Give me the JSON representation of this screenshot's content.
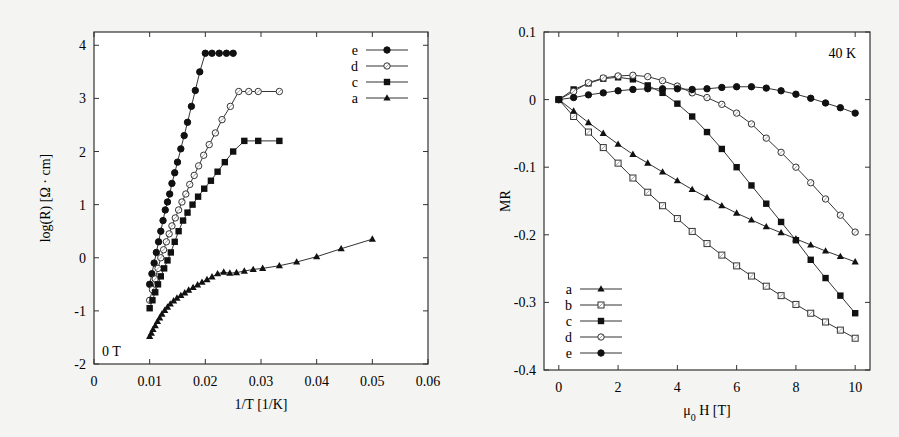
{
  "chart_data": [
    {
      "type": "line",
      "title": "",
      "annotation": "0 T",
      "xlabel": "1/T [1/K]",
      "ylabel": "log(R) [Ω · cm]",
      "xlim": [
        0,
        0.06
      ],
      "ylim": [
        -2,
        4.25
      ],
      "xticks": [
        "0",
        "0.01",
        "0.02",
        "0.03",
        "0.04",
        "0.05",
        "0.06"
      ],
      "yticks": [
        "-2",
        "-1",
        "0",
        "1",
        "2",
        "3",
        "4"
      ],
      "grid": false,
      "legend_position": "top-right",
      "legend": [
        "e",
        "d",
        "c",
        "a"
      ],
      "series": [
        {
          "name": "e",
          "marker": "filled-circle",
          "x": [
            0.01,
            0.0104,
            0.0108,
            0.0112,
            0.0116,
            0.012,
            0.0124,
            0.0128,
            0.0132,
            0.0136,
            0.014,
            0.0145,
            0.015,
            0.0156,
            0.0162,
            0.0168,
            0.0175,
            0.0182,
            0.019,
            0.02,
            0.0212,
            0.0225,
            0.0238,
            0.025
          ],
          "y": [
            -0.5,
            -0.3,
            -0.1,
            0.1,
            0.3,
            0.5,
            0.7,
            0.9,
            1.05,
            1.2,
            1.4,
            1.6,
            1.8,
            2.05,
            2.3,
            2.55,
            2.85,
            3.15,
            3.5,
            3.85,
            3.85,
            3.85,
            3.85,
            3.85
          ]
        },
        {
          "name": "d",
          "marker": "open-circle",
          "x": [
            0.01,
            0.0105,
            0.011,
            0.0115,
            0.012,
            0.0125,
            0.013,
            0.0135,
            0.014,
            0.0146,
            0.0152,
            0.0158,
            0.0165,
            0.0172,
            0.018,
            0.0188,
            0.0197,
            0.0207,
            0.0218,
            0.023,
            0.0245,
            0.026,
            0.0278,
            0.0295,
            0.0333
          ],
          "y": [
            -0.8,
            -0.6,
            -0.4,
            -0.2,
            0.0,
            0.15,
            0.3,
            0.45,
            0.6,
            0.75,
            0.9,
            1.05,
            1.2,
            1.38,
            1.55,
            1.73,
            1.93,
            2.13,
            2.35,
            2.6,
            2.85,
            3.13,
            3.13,
            3.13,
            3.13
          ]
        },
        {
          "name": "c",
          "marker": "filled-square",
          "x": [
            0.01,
            0.0105,
            0.011,
            0.0115,
            0.012,
            0.0126,
            0.0132,
            0.0138,
            0.0145,
            0.0152,
            0.016,
            0.0168,
            0.0177,
            0.0187,
            0.0198,
            0.021,
            0.0222,
            0.0235,
            0.025,
            0.027,
            0.0295,
            0.0333
          ],
          "y": [
            -0.95,
            -0.8,
            -0.65,
            -0.5,
            -0.35,
            -0.2,
            -0.05,
            0.1,
            0.3,
            0.5,
            0.7,
            0.85,
            1.0,
            1.15,
            1.3,
            1.45,
            1.62,
            1.8,
            2.0,
            2.2,
            2.2,
            2.2
          ]
        },
        {
          "name": "a",
          "marker": "filled-triangle",
          "x": [
            0.01,
            0.0103,
            0.0106,
            0.011,
            0.0114,
            0.0118,
            0.0122,
            0.0127,
            0.0132,
            0.0137,
            0.0143,
            0.0149,
            0.0156,
            0.0163,
            0.017,
            0.0178,
            0.0186,
            0.0194,
            0.0203,
            0.0212,
            0.0222,
            0.0233,
            0.0244,
            0.0256,
            0.027,
            0.0286,
            0.0303,
            0.0333,
            0.0364,
            0.04,
            0.0444,
            0.05
          ],
          "y": [
            -1.48,
            -1.42,
            -1.35,
            -1.28,
            -1.2,
            -1.13,
            -1.06,
            -0.99,
            -0.93,
            -0.87,
            -0.81,
            -0.76,
            -0.71,
            -0.66,
            -0.61,
            -0.56,
            -0.51,
            -0.46,
            -0.41,
            -0.36,
            -0.3,
            -0.27,
            -0.29,
            -0.28,
            -0.25,
            -0.22,
            -0.2,
            -0.15,
            -0.08,
            0.02,
            0.17,
            0.35
          ]
        }
      ]
    },
    {
      "type": "line",
      "title": "",
      "annotation": "40 K",
      "xlabel": "μ0 H [T]",
      "xlabel_main": "μ",
      "xlabel_sub": "0",
      "xlabel_rest": " H [T]",
      "ylabel": "MR",
      "xlim": [
        -0.5,
        10.5
      ],
      "ylim": [
        -0.4,
        0.1
      ],
      "xticks": [
        "0",
        "2",
        "4",
        "6",
        "8",
        "10"
      ],
      "yticks": [
        "0.1",
        "0",
        "-0.1",
        "-0.2",
        "-0.3",
        "-0.4"
      ],
      "grid": false,
      "legend_position": "bottom-left",
      "legend": [
        "a",
        "b",
        "c",
        "d",
        "e"
      ],
      "series": [
        {
          "name": "a",
          "marker": "filled-triangle",
          "x": [
            0,
            0.5,
            1,
            1.5,
            2,
            2.5,
            3,
            3.5,
            4,
            4.5,
            5,
            5.5,
            6,
            6.5,
            7,
            7.5,
            8,
            8.5,
            9,
            9.5,
            10
          ],
          "y": [
            0,
            -0.017,
            -0.034,
            -0.05,
            -0.066,
            -0.081,
            -0.094,
            -0.107,
            -0.12,
            -0.133,
            -0.145,
            -0.157,
            -0.168,
            -0.178,
            -0.188,
            -0.197,
            -0.206,
            -0.215,
            -0.224,
            -0.232,
            -0.24
          ]
        },
        {
          "name": "b",
          "marker": "open-square",
          "x": [
            0,
            0.5,
            1,
            1.5,
            2,
            2.5,
            3,
            3.5,
            4,
            4.5,
            5,
            5.5,
            6,
            6.5,
            7,
            7.5,
            8,
            8.5,
            9,
            9.5,
            10
          ],
          "y": [
            0,
            -0.025,
            -0.048,
            -0.071,
            -0.094,
            -0.116,
            -0.137,
            -0.157,
            -0.176,
            -0.195,
            -0.213,
            -0.23,
            -0.246,
            -0.261,
            -0.276,
            -0.29,
            -0.303,
            -0.316,
            -0.329,
            -0.341,
            -0.353
          ]
        },
        {
          "name": "c",
          "marker": "filled-square",
          "x": [
            0,
            0.5,
            1,
            1.5,
            2,
            2.5,
            3,
            3.5,
            4,
            4.5,
            5,
            5.5,
            6,
            6.5,
            7,
            7.5,
            8,
            8.5,
            9,
            9.5,
            10
          ],
          "y": [
            0,
            0.015,
            0.024,
            0.031,
            0.033,
            0.03,
            0.021,
            0.01,
            -0.006,
            -0.025,
            -0.048,
            -0.073,
            -0.1,
            -0.127,
            -0.154,
            -0.181,
            -0.208,
            -0.237,
            -0.264,
            -0.29,
            -0.316
          ]
        },
        {
          "name": "d",
          "marker": "open-circle",
          "x": [
            0,
            0.5,
            1,
            1.5,
            2,
            2.5,
            3,
            3.5,
            4,
            4.5,
            5,
            5.5,
            6,
            6.5,
            7,
            7.5,
            8,
            8.5,
            9,
            9.5,
            10
          ],
          "y": [
            0,
            0.012,
            0.025,
            0.032,
            0.035,
            0.036,
            0.034,
            0.028,
            0.02,
            0.01,
            0.003,
            -0.007,
            -0.02,
            -0.036,
            -0.057,
            -0.078,
            -0.1,
            -0.123,
            -0.147,
            -0.171,
            -0.196
          ]
        },
        {
          "name": "e",
          "marker": "filled-circle",
          "x": [
            0,
            0.5,
            1,
            1.5,
            2,
            2.5,
            3,
            3.5,
            4,
            4.5,
            5,
            5.5,
            6,
            6.5,
            7,
            7.5,
            8,
            8.5,
            9,
            9.5,
            10
          ],
          "y": [
            0,
            0.003,
            0.007,
            0.01,
            0.013,
            0.015,
            0.016,
            0.016,
            0.016,
            0.015,
            0.016,
            0.018,
            0.019,
            0.019,
            0.017,
            0.013,
            0.008,
            0.002,
            -0.005,
            -0.012,
            -0.02
          ]
        }
      ]
    }
  ]
}
